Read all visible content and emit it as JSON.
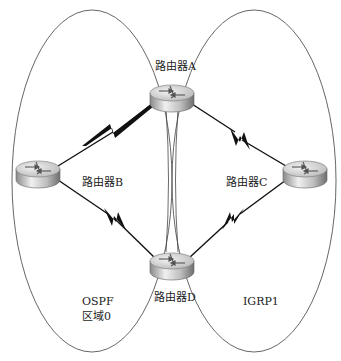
{
  "diagram": {
    "type": "network-topology",
    "colors": {
      "background": "#ffffff",
      "ellipse_stroke": "#555555",
      "link_stroke": "#111111",
      "router_body_light": "#e8e8e8",
      "router_body_dark": "#7a7a7a",
      "router_top": "#d0d0d0"
    },
    "areas": [
      {
        "id": "ospf",
        "line1": "OSPF",
        "line2": "区域0"
      },
      {
        "id": "igrp",
        "line1": "IGRP1"
      }
    ],
    "routers": [
      {
        "id": "A",
        "label": "路由器A"
      },
      {
        "id": "B",
        "label": "路由器B"
      },
      {
        "id": "C",
        "label": "路由器C"
      },
      {
        "id": "D",
        "label": "路由器D"
      }
    ],
    "links": [
      {
        "from": "A",
        "to": "B",
        "type": "serial"
      },
      {
        "from": "A",
        "to": "C",
        "type": "serial"
      },
      {
        "from": "B",
        "to": "D",
        "type": "serial"
      },
      {
        "from": "C",
        "to": "D",
        "type": "serial"
      },
      {
        "from": "A",
        "to": "D",
        "type": "ethernet-pair"
      }
    ]
  }
}
